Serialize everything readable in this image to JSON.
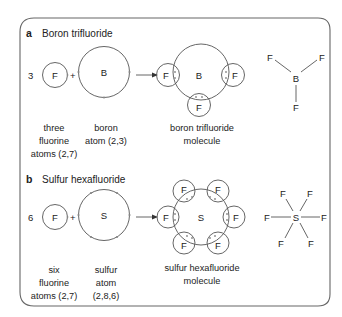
{
  "sections": [
    {
      "letter": "a",
      "title": "Boron trifluoride",
      "coefficient": "3",
      "reactant1_symbol": "F",
      "plus": "+",
      "reactant2_symbol": "B",
      "molecule_center_symbol": "B",
      "molecule_outer_symbol": "F",
      "labels": {
        "reactant1": [
          "three",
          "fluorine",
          "atoms (2,7)"
        ],
        "reactant2": [
          "boron",
          "atom (2,3)"
        ],
        "product": [
          "boron trifluoride",
          "molecule"
        ]
      },
      "structure": {
        "center": "B",
        "outer": "F"
      }
    },
    {
      "letter": "b",
      "title": "Sulfur hexafluoride",
      "coefficient": "6",
      "reactant1_symbol": "F",
      "plus": "+",
      "reactant2_symbol": "S",
      "molecule_center_symbol": "S",
      "molecule_outer_symbol": "F",
      "labels": {
        "reactant1": [
          "six",
          "fluorine",
          "atoms (2,7)"
        ],
        "reactant2": [
          "sulfur",
          "atom",
          "(2,8,6)"
        ],
        "product": [
          "sulfur hexafluoride",
          "molecule"
        ]
      },
      "structure": {
        "center": "S",
        "outer": "F"
      }
    }
  ]
}
